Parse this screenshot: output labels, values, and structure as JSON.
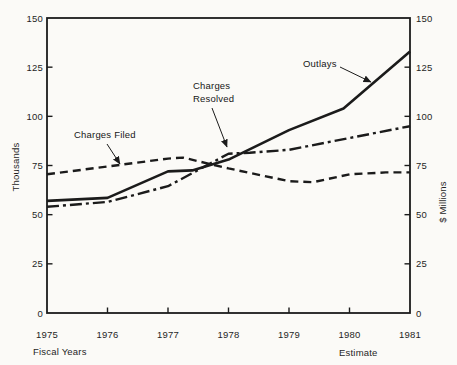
{
  "chart_data": {
    "type": "line",
    "title": "",
    "xlim": [
      1975,
      1981
    ],
    "ylim": [
      0,
      150
    ],
    "x": [
      1975,
      1976,
      1977,
      1978,
      1979,
      1980,
      1981
    ],
    "x_tick_labels": [
      "1975",
      "1976",
      "1977",
      "1978",
      "1979",
      "1980",
      "1981"
    ],
    "y_ticks": [
      0,
      25,
      50,
      75,
      100,
      125,
      150
    ],
    "left_axis_title": "Thousands",
    "right_axis_title": "$ Millions",
    "x_axis_title": "Fiscal Years",
    "x_axis_note": "Estimate",
    "grid": false,
    "series": [
      {
        "name": "Charges Filed",
        "style": "dashed",
        "axis": "left (Thousands)",
        "values": [
          70.5,
          74.5,
          78.5,
          73.5,
          67,
          70.5,
          71.5
        ],
        "shape_points": [
          [
            1975,
            70.5
          ],
          [
            1976,
            74.5
          ],
          [
            1977,
            78.5
          ],
          [
            1977.25,
            79
          ],
          [
            1978,
            73.5
          ],
          [
            1979,
            67
          ],
          [
            1979.4,
            66.5
          ],
          [
            1980,
            70.5
          ],
          [
            1980.6,
            71.5
          ],
          [
            1981,
            71.5
          ]
        ]
      },
      {
        "name": "Charges Resolved",
        "style": "dashdot",
        "axis": "left (Thousands)",
        "values": [
          54,
          56.5,
          64.5,
          81,
          83,
          89,
          95
        ],
        "shape_points": [
          [
            1975,
            54
          ],
          [
            1976,
            56.5
          ],
          [
            1977,
            64.5
          ],
          [
            1978,
            81
          ],
          [
            1978.35,
            81.5
          ],
          [
            1979,
            83
          ],
          [
            1980,
            89
          ],
          [
            1981,
            95
          ]
        ]
      },
      {
        "name": "Outlays",
        "style": "solid",
        "axis": "right ($ Millions)",
        "values": [
          57,
          58.5,
          72,
          78,
          93,
          104.5,
          133
        ],
        "shape_points": [
          [
            1975,
            57
          ],
          [
            1976,
            58.5
          ],
          [
            1977,
            72
          ],
          [
            1977.4,
            72.5
          ],
          [
            1978,
            78
          ],
          [
            1979,
            93
          ],
          [
            1979.9,
            104
          ],
          [
            1981,
            133
          ]
        ]
      }
    ],
    "annotations": [
      {
        "label": "Charges Filed",
        "lines": [
          "Charges Filed"
        ],
        "points_to": "dashed line"
      },
      {
        "label": "Charges Resolved",
        "lines": [
          "Charges",
          "Resolved"
        ],
        "points_to": "dash-dot line"
      },
      {
        "label": "Outlays",
        "lines": [
          "Outlays"
        ],
        "points_to": "solid line"
      }
    ]
  },
  "colors": {
    "ink": "#1b1b1b",
    "paper": "#fbfaf7"
  }
}
